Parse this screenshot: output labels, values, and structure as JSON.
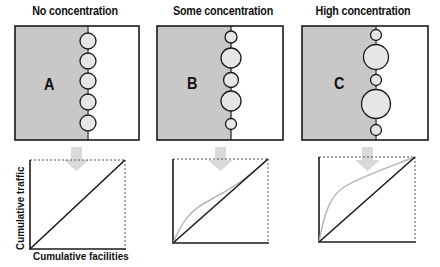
{
  "panels": [
    {
      "title": "No concentration",
      "letter": "A",
      "circle_radii": [
        8,
        8,
        8,
        8,
        8
      ],
      "curve": "linear"
    },
    {
      "title": "Some concentration",
      "letter": "B",
      "circle_radii": [
        6,
        10,
        7.5,
        10,
        5.5
      ],
      "curve": "moderate"
    },
    {
      "title": "High concentration",
      "letter": "C",
      "circle_radii": [
        5.5,
        12.5,
        5.5,
        14.5,
        5.5
      ],
      "curve": "strong"
    }
  ],
  "axes": {
    "ylabel": "Cumulative traffic",
    "xlabel": "Cumulative facilities"
  },
  "colors": {
    "shade": "#c8c8c8",
    "circle_fill": "#e6e6e6",
    "line": "#1a1a1a",
    "curve": "#b4b4b4",
    "arrow": "#d9d9d9"
  }
}
